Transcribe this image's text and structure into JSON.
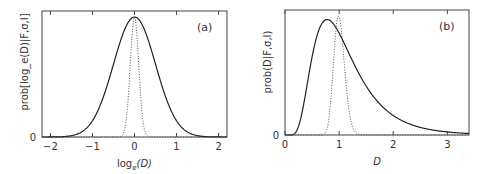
{
  "chart_data": [
    {
      "type": "line",
      "panel_label": "(a)",
      "xlabel": "log_e(D)",
      "xlabel_main": "log",
      "xlabel_sub": "e",
      "xlabel_arg": "(D)",
      "ylabel": "prob[log_e(D)|F,σ,I]",
      "xlim": [
        -2.2,
        2.2
      ],
      "ylim": [
        0,
        1.05
      ],
      "xticks": [
        -2,
        -1,
        0,
        1,
        2
      ],
      "xtick_labels": [
        "−2",
        "−1",
        "0",
        "1",
        "2"
      ],
      "yticks": [
        0
      ],
      "ytick_labels": [
        "0"
      ],
      "grid": false,
      "series": [
        {
          "name": "broad posterior (solid)",
          "style": "solid",
          "distribution": "gaussian",
          "mean": 0,
          "sigma": 0.5,
          "peak": 1.0
        },
        {
          "name": "narrow posterior (dotted)",
          "style": "dotted",
          "distribution": "gaussian",
          "mean": 0,
          "sigma": 0.1,
          "peak": 1.0
        }
      ]
    },
    {
      "type": "line",
      "panel_label": "(b)",
      "xlabel": "D",
      "ylabel": "prob(D|F,σ,I)",
      "xlim": [
        0,
        3.4
      ],
      "ylim": [
        0,
        1.05
      ],
      "xticks": [
        0,
        1,
        2,
        3
      ],
      "xtick_labels": [
        "0",
        "1",
        "2",
        "3"
      ],
      "yticks": [
        0
      ],
      "ytick_labels": [
        "0"
      ],
      "grid": false,
      "series": [
        {
          "name": "broad posterior (solid)",
          "style": "solid",
          "distribution": "lognormal",
          "mu": 0,
          "sigma": 0.5,
          "mode": 0.78,
          "peak": 0.97
        },
        {
          "name": "narrow posterior (dotted)",
          "style": "dotted",
          "distribution": "lognormal",
          "mu": 0,
          "sigma": 0.1,
          "mode": 0.99,
          "peak": 1.0
        }
      ]
    }
  ]
}
